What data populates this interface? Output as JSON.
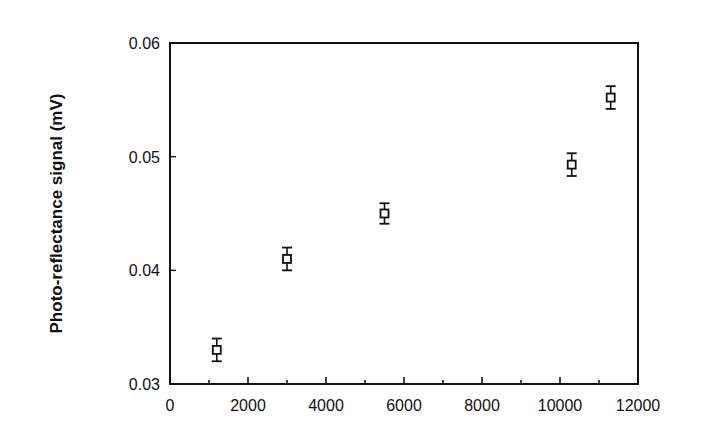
{
  "chart_data": {
    "type": "scatter",
    "title": "",
    "xlabel": "",
    "ylabel": "Photo-reflectance signal (mV)",
    "xlim": [
      0,
      12000
    ],
    "ylim": [
      0.03,
      0.06
    ],
    "x_ticks": [
      "0",
      "2000",
      "4000",
      "6000",
      "8000",
      "10000",
      "12000"
    ],
    "y_ticks": [
      "0.03",
      "0.04",
      "0.05",
      "0.06"
    ],
    "grid": false,
    "legend": null,
    "marker": "open-square",
    "series": [
      {
        "name": "Photo-reflectance signal",
        "x": [
          1200,
          3000,
          5500,
          10300,
          11300
        ],
        "y": [
          0.033,
          0.041,
          0.045,
          0.0493,
          0.0552
        ],
        "yerr": [
          0.001,
          0.001,
          0.0009,
          0.001,
          0.001
        ]
      }
    ]
  }
}
